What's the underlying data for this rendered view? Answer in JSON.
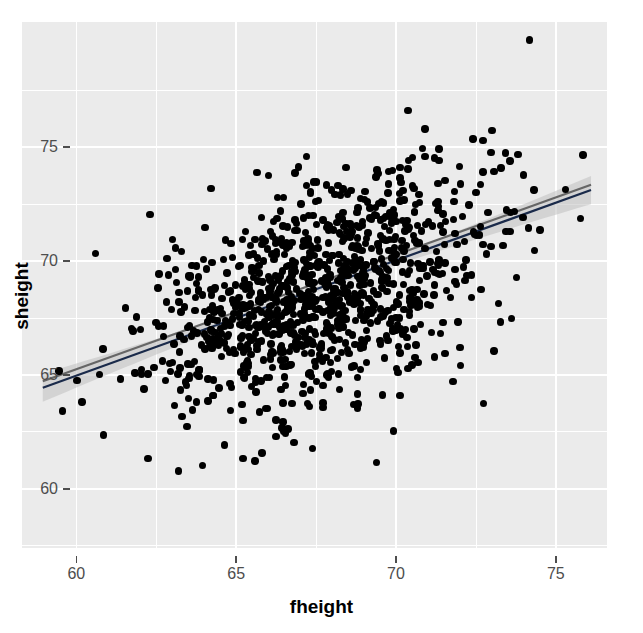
{
  "figure": {
    "kind": "scatterplot-with-regression",
    "background_color": "#ffffff",
    "panel_color": "#ebebeb",
    "gridline_color": "#ffffff",
    "point_color": "#000000",
    "axis_text_color": "#4d4d4d",
    "axis_title_color": "#000000"
  },
  "chart_data": {
    "type": "scatter",
    "title": "",
    "subtitle": "",
    "xlabel": "fheight",
    "ylabel": "sheight",
    "xlim": [
      58.3,
      76.6
    ],
    "ylim": [
      57.4,
      80.5
    ],
    "grid": true,
    "legend_position": "none",
    "xticks": [
      60,
      65,
      70,
      75
    ],
    "xtick_labels": [
      "60",
      "65",
      "70",
      "75"
    ],
    "yticks": [
      60,
      65,
      70,
      75
    ],
    "ytick_labels": [
      "60",
      "65",
      "70",
      "75"
    ],
    "x_minor_ticks": [
      57.5,
      62.5,
      67.5,
      72.5
    ],
    "y_minor_ticks": [
      57.5,
      62.5,
      67.5,
      72.5,
      77.5
    ],
    "n_points": 1078,
    "point_size": 7.4,
    "point_alpha": 1.0,
    "distribution": {
      "x_mean": 67.7,
      "x_sd": 2.75,
      "y_mean": 68.6,
      "y_sd": 2.7,
      "correlation": 0.52
    },
    "series": [
      {
        "name": "observations",
        "kind": "points",
        "color": "#000000",
        "x_range": [
          58.9,
          76.3
        ],
        "y_range": [
          58.3,
          77.2
        ]
      },
      {
        "name": "lm fit",
        "kind": "line",
        "color": "#1a2a4a",
        "x_endpoints": [
          58.95,
          76.1
        ],
        "y_endpoints": [
          64.44,
          73.12
        ],
        "slope": 0.506,
        "intercept": 34.6
      },
      {
        "name": "loess fit",
        "kind": "line",
        "color": "#666666",
        "x_endpoints": [
          58.95,
          76.1
        ],
        "y_endpoints": [
          64.72,
          73.35
        ],
        "slope": 0.503
      },
      {
        "name": "confidence ribbon (95%)",
        "kind": "ribbon",
        "color": "#bfbfbf",
        "opacity": 0.55,
        "x_endpoints": [
          58.95,
          76.1
        ],
        "half_width_at_ends": 0.62,
        "half_width_at_center": 0.12
      }
    ],
    "annotations": []
  },
  "axes": {
    "x_title": "fheight",
    "y_title": "sheight",
    "x_tick_labels": [
      "60",
      "65",
      "70",
      "75"
    ],
    "y_tick_labels": [
      "75",
      "70",
      "65",
      "60"
    ]
  }
}
